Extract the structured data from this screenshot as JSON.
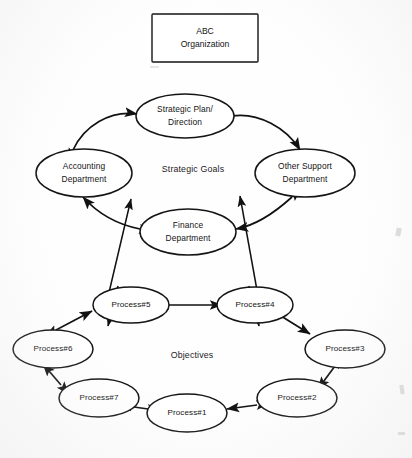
{
  "diagram": {
    "title_box": {
      "line1": "ABC",
      "line2": "Organization"
    },
    "section_labels": {
      "upper": "Strategic Goals",
      "lower": "Objectives"
    },
    "upper_cycle": {
      "nodes": [
        {
          "id": "strategic-plan",
          "line1": "Strategic Plan/",
          "line2": "Direction"
        },
        {
          "id": "other-support",
          "line1": "Other Support",
          "line2": "Department"
        },
        {
          "id": "finance",
          "line1": "Finance",
          "line2": "Department"
        },
        {
          "id": "accounting",
          "line1": "Accounting",
          "line2": "Department"
        }
      ]
    },
    "lower_cycle": {
      "nodes": [
        {
          "id": "process-5",
          "label": "Process#5"
        },
        {
          "id": "process-4",
          "label": "Process#4"
        },
        {
          "id": "process-3",
          "label": "Process#3"
        },
        {
          "id": "process-2",
          "label": "Process#2"
        },
        {
          "id": "process-1",
          "label": "Process#1"
        },
        {
          "id": "process-7",
          "label": "Process#7"
        },
        {
          "id": "process-6",
          "label": "Process#6"
        }
      ]
    },
    "colors": {
      "stroke": "#111111",
      "text": "#131313",
      "background": "#fefefe"
    }
  }
}
